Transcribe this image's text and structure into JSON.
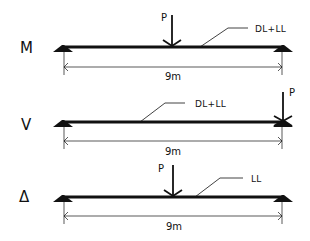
{
  "diagram": {
    "type": "beam-load-cases",
    "colors": {
      "ink": "#111111",
      "background": "#ffffff"
    },
    "rows": [
      {
        "label": "M",
        "load_label": "DL+LL",
        "point_load": {
          "label": "P",
          "position": "midspan",
          "direction": "down"
        },
        "span": "9m"
      },
      {
        "label": "V",
        "load_label": "DL+LL",
        "point_load": {
          "label": "P",
          "position": "right-support",
          "direction": "up"
        },
        "span": "9m"
      },
      {
        "label": "Δ",
        "load_label": "LL",
        "point_load": {
          "label": "P",
          "position": "midspan",
          "direction": "down"
        },
        "span": "9m"
      }
    ]
  }
}
